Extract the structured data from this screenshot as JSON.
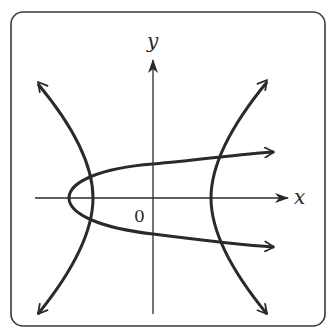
{
  "diagram": {
    "type": "graph-sketch",
    "labels": {
      "x_axis": "x",
      "y_axis": "y",
      "origin": "0"
    },
    "curves": [
      {
        "name": "parabola",
        "opens": "right",
        "vertex_px": [
          69,
          198
        ]
      },
      {
        "name": "hyperbola-left-branch",
        "vertex_px": [
          93,
          198
        ]
      },
      {
        "name": "hyperbola-right-branch",
        "vertex_px": [
          211,
          198
        ]
      }
    ],
    "intersection_count": 4,
    "colors": {
      "stroke": "#2a2a2a",
      "frame": "#3a3a3a",
      "background": "#ffffff"
    }
  }
}
